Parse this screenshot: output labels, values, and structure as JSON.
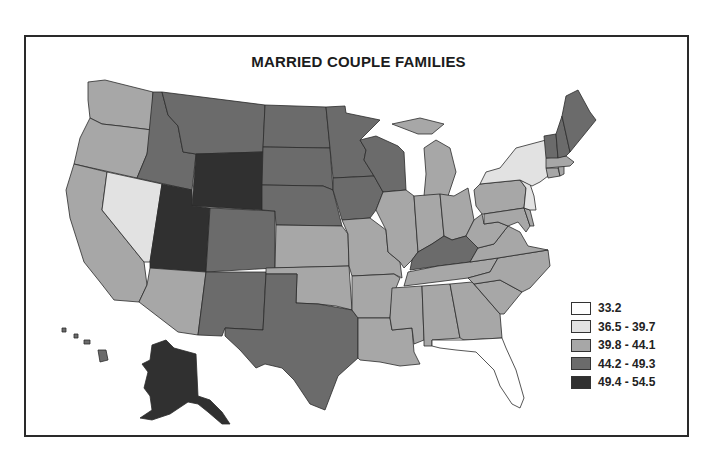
{
  "title": "MARRIED COUPLE FAMILIES",
  "legend": [
    {
      "label": "33.2",
      "color": "#ffffff"
    },
    {
      "label": "36.5 - 39.7",
      "color": "#e2e2e2"
    },
    {
      "label": "39.8 - 44.1",
      "color": "#a7a7a7"
    },
    {
      "label": "44.2 - 49.3",
      "color": "#6b6b6b"
    },
    {
      "label": "49.4 - 54.5",
      "color": "#303030"
    }
  ],
  "states": {
    "FL": 0,
    "NV": 1,
    "NY": 1,
    "NJ": 1,
    "WA": 2,
    "OR": 2,
    "CA": 2,
    "AZ": 2,
    "KS": 2,
    "OK": 2,
    "MO": 2,
    "AR": 2,
    "LA": 2,
    "IL": 2,
    "IN": 2,
    "MI": 2,
    "OH": 2,
    "PA": 2,
    "WV": 2,
    "VA": 2,
    "NC": 2,
    "SC": 2,
    "GA": 2,
    "AL": 2,
    "MS": 2,
    "TN": 2,
    "MD": 2,
    "DE": 2,
    "CT": 2,
    "MA": 2,
    "RI": 2,
    "ID": 3,
    "MT": 3,
    "CO": 3,
    "NM": 3,
    "TX": 3,
    "ND": 3,
    "SD": 3,
    "NE": 3,
    "MN": 3,
    "IA": 3,
    "WI": 3,
    "KY": 3,
    "VT": 3,
    "NH": 3,
    "ME": 3,
    "HI": 3,
    "WY": 4,
    "UT": 4,
    "AK": 4
  }
}
